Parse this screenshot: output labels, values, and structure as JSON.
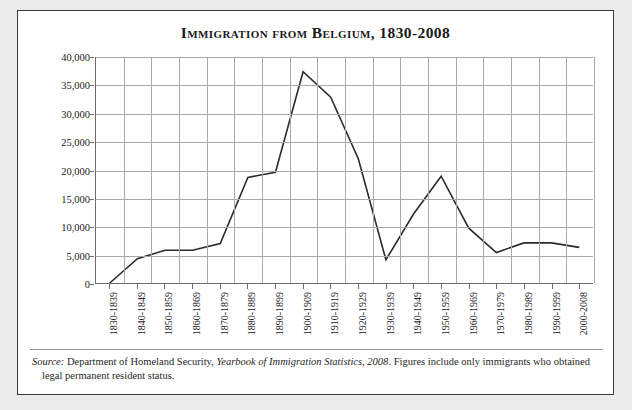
{
  "figure": {
    "title": "Immigration from Belgium, 1830-2008",
    "source_prefix": "Source:",
    "source_agency": "Department of Homeland Security,",
    "source_publication": "Yearbook of Immigration Statistics, 2008",
    "source_rest": ". Figures include only immigrants who obtained legal permanent resident status."
  },
  "chart_data": {
    "type": "line",
    "title": "Immigration from Belgium, 1830-2008",
    "xlabel": "",
    "ylabel": "Total immigrants per decade",
    "categories": [
      "1830-1839",
      "1840-1849",
      "1850-1859",
      "1860-1869",
      "1870-1879",
      "1880-1889",
      "1890-1899",
      "1900-1909",
      "1910-1919",
      "1920-1929",
      "1930-1939",
      "1940-1949",
      "1950-1959",
      "1960-1969",
      "1970-1979",
      "1980-1989",
      "1990-1999",
      "2000-2008"
    ],
    "values": [
      0,
      4300,
      5800,
      5800,
      7000,
      18700,
      19600,
      37400,
      32900,
      22000,
      4100,
      12200,
      18900,
      9700,
      5400,
      7100,
      7100,
      6300
    ],
    "ylim": [
      0,
      40000
    ],
    "yticks": [
      0,
      5000,
      10000,
      15000,
      20000,
      25000,
      30000,
      35000,
      40000
    ],
    "ytick_labels": [
      "0",
      "5,000",
      "10,000",
      "15,000",
      "20,000",
      "25,000",
      "30,000",
      "35,000",
      "40,000"
    ],
    "grid": true,
    "legend": false,
    "line_color": "#2b2b2b",
    "grid_color": "#a9a9a9",
    "axis_color": "#6d6d6d",
    "background_color": "#ffffff"
  }
}
